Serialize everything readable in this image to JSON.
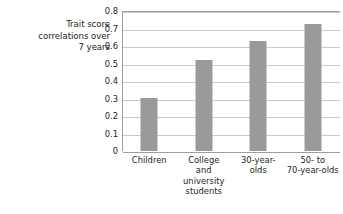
{
  "chart_data": {
    "type": "bar",
    "title": "",
    "xlabel": "",
    "ylabel": "Trait score correlations over 7 years",
    "ylabel_lines": [
      "Trait score",
      "correlations over",
      "7 years"
    ],
    "categories": [
      "Children",
      "College and university students",
      "30-year-olds",
      "50- to 70-year-olds"
    ],
    "category_lines": [
      [
        "Children"
      ],
      [
        "College",
        "and",
        "university",
        "students"
      ],
      [
        "30-year-",
        "olds"
      ],
      [
        "50- to",
        "70-year-olds"
      ]
    ],
    "values": [
      0.305,
      0.52,
      0.63,
      0.725
    ],
    "ylim": [
      0,
      0.8
    ],
    "ytick_values": [
      0,
      0.1,
      0.2,
      0.3,
      0.4,
      0.5,
      0.6,
      0.7,
      0.8
    ],
    "ytick_labels": [
      "0",
      "0.1",
      "0.2",
      "0.3",
      "0.4",
      "0.5",
      "0.6",
      "0.7",
      "0.8"
    ],
    "grid": true,
    "legend": false,
    "legend_position": "none",
    "colors": {
      "bar": "#9a9a9a",
      "gridline": "#c9c9c9",
      "axis": "#9e9e9e",
      "text": "#231f20",
      "background": "#ffffff"
    }
  }
}
